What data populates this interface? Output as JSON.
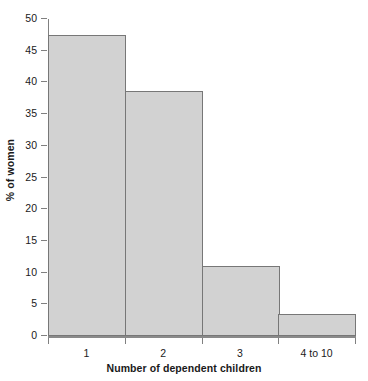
{
  "chart_data": {
    "type": "bar",
    "title": "",
    "xlabel": "Number of dependent children",
    "ylabel": "% of women",
    "categories": [
      "1",
      "2",
      "3",
      "4 to 10"
    ],
    "values": [
      47.5,
      38.7,
      11.0,
      3.4
    ],
    "ylim": [
      0,
      50
    ],
    "yticks": [
      0,
      5,
      10,
      15,
      20,
      25,
      30,
      35,
      40,
      45,
      50
    ],
    "ytick_labels": [
      "0",
      "5",
      "10",
      "15",
      "20",
      "25",
      "30",
      "35",
      "40",
      "45",
      "50"
    ],
    "grid": false,
    "legend": "none",
    "bar_fill_color": "#d2d2d2",
    "bar_border_color": "#777777",
    "axis_color": "#808080",
    "background_color": "#ffffff"
  }
}
